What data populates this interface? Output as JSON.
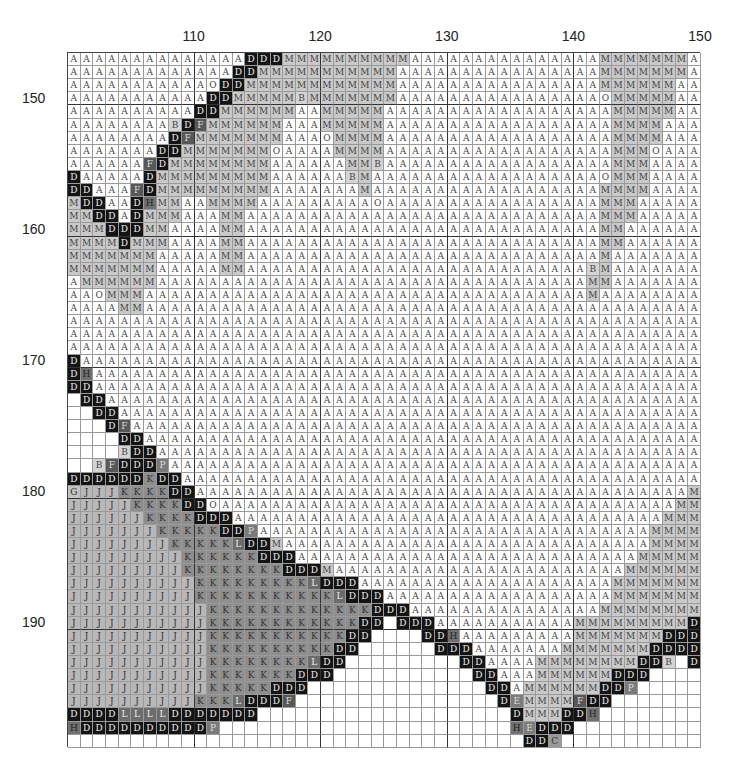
{
  "chart_data": {
    "type": "table",
    "x_start": 101,
    "x_end": 150,
    "y_start": 147,
    "y_end": 199,
    "col_tick_labels": [
      {
        "label": "110",
        "after_col": 110
      },
      {
        "label": "120",
        "after_col": 120
      },
      {
        "label": "130",
        "after_col": 130
      },
      {
        "label": "140",
        "after_col": 140
      },
      {
        "label": "150",
        "after_col": 150
      }
    ],
    "row_tick_labels": [
      {
        "label": "150",
        "row": 150
      },
      {
        "label": "160",
        "row": 160
      },
      {
        "label": "170",
        "row": 170
      },
      {
        "label": "180",
        "row": 180
      },
      {
        "label": "190",
        "row": 190
      }
    ],
    "grid_major_every": 10,
    "blank_symbol": "_",
    "symbol_shades": {
      "A": "#ffffff",
      "O": "#ffffff",
      "M": "#c9c9c9",
      "B": "#d4d4d4",
      "D": "#141414",
      "J": "#b8b8b8",
      "K": "#8e8e8e",
      "L": "#6c6c6c",
      "F": "#585858",
      "P": "#7a7a7a",
      "H": "#707070",
      "G": "#c2c2c2",
      "E": "#7c7c7c",
      "C": "#9a9a9a"
    },
    "rows": [
      "AAAAAAAAAAAAAADDDMMMMMMMMMMAAAAAAAAAAAAAAAMMMMMMMA",
      "AAAAAAAAAAAAADDMMMMMMMMMMMAAAAAAAAAAAAAAAAMMMMMMMA",
      "AAAAAAAAAAAODDMMMMMMMMMMMMAAAAAAAAAAAAAAAAMMMMMMAA",
      "AAAAAAAAAAADDMMMMMBMMMMMMMAAAAAAAAAAAAAAAAOMMMMMAA",
      "AAAAAAAAAADDMMMMMMAAMMMMMAAAAAAAAAAAAAAAAAAMMMMMAA",
      "AAAAAAAABDFMMMMMMAAAMMMMMAAAAAAAAAAAAAAAAAAMMMMAAA",
      "AAAAAAAADFMMMMMMMAAAOMMMMAAAAAAAAAAAAAAAAAAMMMMAAA",
      "AAAAAAADDMMMMMMMOAAAAMMMMAAAAAAAAAAAAAAAAAAMMMOAAA",
      "AAAAAAFDMMMMMMMMAAAAAAMMBAAAAAAAAAAAAAAAAAAMMMAAAA",
      "DAAAAADMMMMMMMMMAAAAAABMAAAAAAAAAAAAAAAAAAOMMMAAAA",
      "DDAAAFDMMMMMMMMMAAAAAAAMAAAAAAAAAAAAAAAAAAMMMMAAAA",
      "MDDAADHMMAAMMMMAAAAAAAAAOAAAAAAAAAAAAAAAAAMMMAAAAA",
      "MMDDADMMMAAAMMAAAAAAAAAAAAAAAAAAAAAAAAAAAAMMMAAAAA",
      "MMMDDDMMAAAAMMAAAAAAAAAAAAAAAAAAAAAAAAAAAAMMAAAAAA",
      "MMMMDMMMAAAAMMAAAAAAAAAAAAAAAAAAAAAAAAAAAAMMAAAAAA",
      "MMMMMMMAAAAAMMAAAAAAAAAAAAAAAAAAAAAAAAAAAAMAAAAAAA",
      "MMMMMMMAAAAAMMAAAAAAAAAAAAAAAAAAAAAAAAAAABMAAAAAAA",
      "AMMMMMMAAAAAAAAAAAAAAAAAAAAAAAAAAAAAAAAAAMMAAAAAAA",
      "AAOMMMAAAAAAAAAAAAAAAAAAAAAAAAAAAAAAAAAAAMAAAAAAAA",
      "AAAAMMAAAAAAAAAAAAAAAAAAAAAAAAAAAAAAAAAAAAAAAAAAAA",
      "AAAAAAAAAAAAAAAAAAAAAAAAAAAAAAAAAAAAAAAAAAAAAAAAAA",
      "AAAAAAAAAAAAAAAAAAAAAAAAAAAAAAAAAAAAAAAAAAAAAAAAAA",
      "AAAAAAAAAAAAAAAAAAAAAAAAAAAAAAAAAAAAAAAAAAAAAAAAAA",
      "DAAAAAAAAAAAAAAAAAAAAAAAAAAAAAAAAAAAAAAAAAAAAAAAAA",
      "DHAAAAAAAAAAAAAAAAAAAAAAAAAAAAAAAAAAAAAAAAAAAAAAAA",
      "DDAAAAAAAAAAAAAAAAAAAAAAAAAAAAAAAAAAAAAAAAAAAAAAAA",
      "_DDAAAAAAAAAAAAAAAAAAAAAAAAAAAAAAAAAAAAAAAAAAAAAAA",
      "__DDAAAAAAAAAAAAAAAAAAAAAAAAAAAAAAAAAAAAAAAAAAAAAA",
      "___DFAAAAAAAAAAAAAAAAAAAAAAAAAAAAAAAAAAAAAAAAAAAAA",
      "____DDAAAAAAAAAAAAAAAAAAAAAAAAAAAAAAAAAAAAAAAAAAAA",
      "____BDDAAAAAAAAAAAAAAAAAAAAAAAAAAAAAAAAAAAAAAAAAAA",
      "__BFDDDPAAAAAAAAAAAAAAAAAAAAAAAAAAAAAAAAAAAAAAAAAA",
      "DDDDDDKDDAAAAAAAAAAAAAAAAAAAAAAAAAAAAAAAAAAAAAAAAA",
      "GJJJKKKKDDAAAAAAAAAAAAAAAAAAAAAAAAAAAAAAAAAAAAAAAM",
      "JJJJJKKKKDDOAAAAAAAAAAAAAAAAAAAAAAAAAAAAAAAAAAAAMM",
      "JJJJJJKKKKDDDAAAAAAAAAAAAAAAAAAAAAAAAAAAAAAAAAAMMM",
      "JJJJJJJKKKKKDDPAAAAAAAAAAAAAAAAAAAAAAAAAAAAAAAMMMM",
      "JJJJJJJJKKKKKLDDMAAAAAAAAAAAAAAAAAAAAAAAAAAAAAMMMM",
      "JJJJJJJJJKKKKKKDDDAAAAAAAAAAAAAAAAAAAAAAAAAAAMMMMM",
      "JJJJJJJJJKKKKKKKKDDDMAAAAAAAAAAAAAAAAAAAAAAAMMMMMM",
      "JJJJJJJJJJKKKKKKKKKLDDDAAAAAAAAAAAAAAAAAAAAMMMMMMM",
      "JJJJJJJJJJKKKKKKKKKKKLDDDAAAAAAAAAAAAAAAAAAMMMMMMM",
      "JJJJJJJJJJJKKKKKKKKKKKKKDDDAAAAAAAAAAAAAAAMMMMMMMM",
      "JJJJJJJJJJJKKKKKKKKKKKKDD_DDDAAAAAAAAAAAMMMMMMMMMD",
      "JJJJJJJJJJJKKKKKKKKKKKDD____DDHAAAAAAAAAMMMMMMMDDD",
      "JJJJJJJJJJJKKKKKKKKKKDD______DDDAAAAAAAMMMMMMMDDDD",
      "JJJJJJJJJJJKKKKKKKKLDD_________DDAAAAMMMMMMMMDDB_D",
      "JJJJJJJJJJJKKKKKKKDDD___________DDAAAMMMMMMDDD____",
      "JJJJJJJJJJJKKKKKDDD______________DDAMMMMMMDDP_____",
      "JJJJJJJJJJKKKLDDDF________________DEMMMMFDD_______",
      "DDDDLLLLDDDDDDD____________________DMMMDDH________",
      "HDDDDDDDDDDP_______________________HEDDD__________",
      "____________________________________DDC___________"
    ]
  }
}
